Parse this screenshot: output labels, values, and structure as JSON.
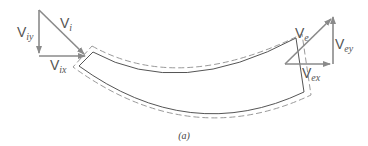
{
  "figure": {
    "caption": "(a)",
    "colors": {
      "vector": "#8a8a8a",
      "body_outline": "#555555",
      "control_volume": "#9a9a9a"
    },
    "inlet": {
      "labels": {
        "vi": {
          "base": "V",
          "sub": "i"
        },
        "viy": {
          "base": "V",
          "sub": "iy"
        },
        "vix": {
          "base": "V",
          "sub": "ix"
        }
      }
    },
    "exit": {
      "labels": {
        "ve": {
          "base": "V",
          "sub": "e"
        },
        "vey": {
          "base": "V",
          "sub": "ey"
        },
        "vex": {
          "base": "V",
          "sub": "ex"
        }
      }
    }
  }
}
